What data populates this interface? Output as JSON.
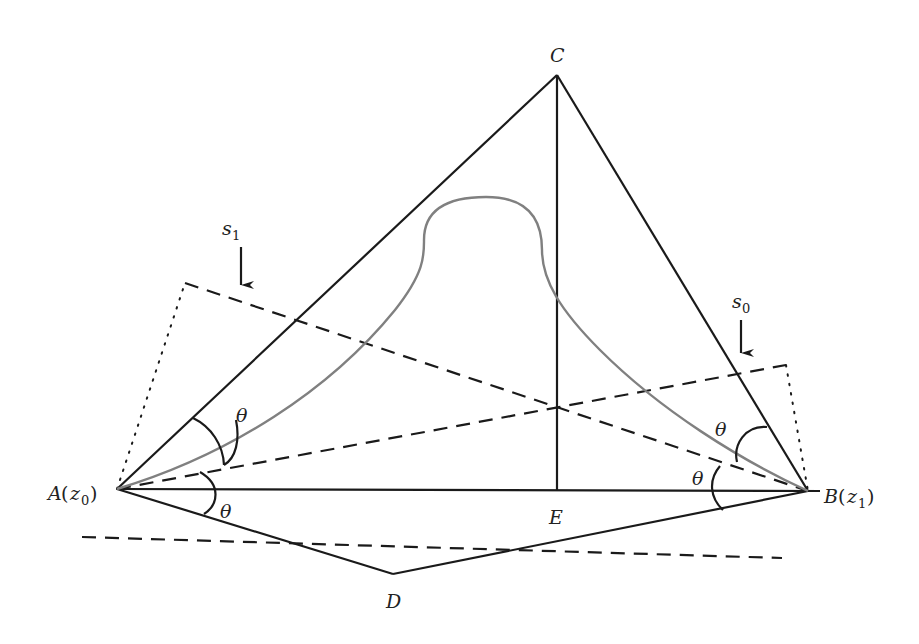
{
  "figure": {
    "type": "geometric-diagram",
    "colors": {
      "line": "#1a1a1a",
      "curve": "#808080",
      "background": "#ffffff"
    },
    "points": {
      "A": {
        "label": "A",
        "arg": "z",
        "arg_sub": "0",
        "x": 117,
        "y": 489
      },
      "B": {
        "label": "B",
        "arg": "z",
        "arg_sub": "1",
        "x": 808,
        "y": 491
      },
      "C": {
        "label": "C",
        "x": 557,
        "y": 75
      },
      "D": {
        "label": "D",
        "x": 393,
        "y": 574
      },
      "E": {
        "label": "E",
        "x": 557,
        "y": 490
      }
    },
    "angle_label": "θ",
    "angle_labels_count": 4,
    "arrows": [
      {
        "name": "s1",
        "symbol": "s",
        "sub": "1"
      },
      {
        "name": "s0",
        "symbol": "s",
        "sub": "0"
      }
    ]
  }
}
